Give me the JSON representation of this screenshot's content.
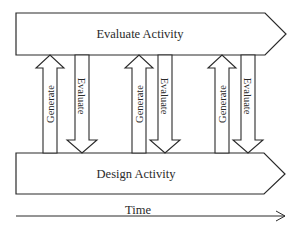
{
  "diagram": {
    "top_box": {
      "label": "Evaluate Activity"
    },
    "bottom_box": {
      "label": "Design Activity"
    },
    "arrow_pairs": [
      {
        "up_label": "Generate",
        "down_label": "Evaluate"
      },
      {
        "up_label": "Generate",
        "down_label": "Evaluate"
      },
      {
        "up_label": "Generate",
        "down_label": "Evaluate"
      }
    ],
    "time_axis": {
      "label": "Time"
    },
    "colors": {
      "stroke": "#2a2a2a",
      "fill": "#ffffff"
    }
  }
}
